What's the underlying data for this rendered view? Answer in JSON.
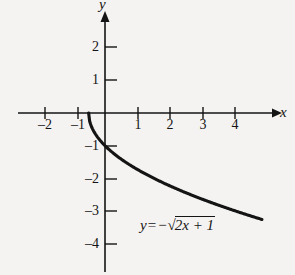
{
  "figure": {
    "background_color": "#f4f3f1",
    "ink_color": "#141414",
    "width": 295,
    "height": 275
  },
  "axes": {
    "x_axis_label": "x",
    "y_axis_label": "y",
    "origin_px": {
      "x": 105,
      "y": 113
    },
    "unit_px": 32.7
  },
  "chart_data": {
    "type": "line",
    "title": "",
    "subtitle": "",
    "xlabel": "x",
    "ylabel": "y",
    "equation": "y = -√(2x + 1)",
    "equation_parts": {
      "lhs": "y",
      "equals": "=",
      "minus": "−",
      "radical": "√",
      "radicand": "2x + 1"
    },
    "xlim": [
      -2.6,
      5.2
    ],
    "ylim": [
      -4.6,
      2.8
    ],
    "xticks": [
      -2,
      -1,
      1,
      2,
      3,
      4
    ],
    "yticks": [
      2,
      1,
      -1,
      -2,
      -3,
      -4
    ],
    "xtick_labels": [
      "–2",
      "–1",
      "1",
      "2",
      "3",
      "4"
    ],
    "ytick_labels": [
      "2",
      "1",
      "–1",
      "–2",
      "–3",
      "–4"
    ],
    "grid": false,
    "legend": "none",
    "annotations": [
      {
        "text": "y = -√(2x + 1)",
        "x": 1.1,
        "y": -3.4
      }
    ],
    "series": [
      {
        "name": "y = -sqrt(2x + 1)",
        "domain": [
          -0.5,
          4.8
        ],
        "x": [
          -0.5,
          -0.45,
          -0.4,
          -0.3,
          -0.2,
          -0.1,
          0,
          0.25,
          0.5,
          1,
          1.5,
          2,
          2.5,
          3,
          3.5,
          4,
          4.5,
          4.8
        ],
        "y": [
          0,
          -0.316,
          -0.447,
          -0.632,
          -0.775,
          -0.894,
          -1,
          -1.225,
          -1.414,
          -1.732,
          -2,
          -2.236,
          -2.449,
          -2.646,
          -2.828,
          -3,
          -3.162,
          -3.256
        ]
      }
    ]
  },
  "ticks": {
    "x": [
      {
        "label": "–2",
        "px": 45
      },
      {
        "label": "–1",
        "px": 78
      },
      {
        "label": "1",
        "px": 138
      },
      {
        "label": "2",
        "px": 170
      },
      {
        "label": "3",
        "px": 203
      },
      {
        "label": "4",
        "px": 235
      }
    ],
    "y": [
      {
        "label": "2",
        "px": 47
      },
      {
        "label": "1",
        "px": 80
      },
      {
        "label": "–1",
        "px": 146
      },
      {
        "label": "–2",
        "px": 179
      },
      {
        "label": "–3",
        "px": 211
      },
      {
        "label": "–4",
        "px": 244
      }
    ]
  }
}
